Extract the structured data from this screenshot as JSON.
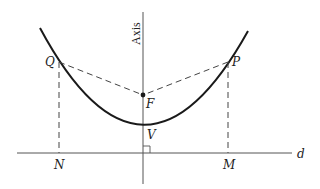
{
  "diagram": {
    "colors": {
      "stroke": "#1a1a1a",
      "dashed": "#444444",
      "text": "#222222",
      "background": "#ffffff"
    },
    "labels": {
      "axis": "Axis",
      "Q": "Q",
      "P": "P",
      "F": "F",
      "V": "V",
      "N": "N",
      "M": "M",
      "d": "d"
    },
    "points": {
      "Q": {
        "x": 59,
        "y": 62
      },
      "P": {
        "x": 228,
        "y": 62
      },
      "F": {
        "x": 143,
        "y": 95
      },
      "V": {
        "x": 143,
        "y": 124
      },
      "N": {
        "x": 59,
        "y": 153
      },
      "M": {
        "x": 228,
        "y": 153
      }
    },
    "elements": [
      "parabola curve",
      "axis of symmetry (vertical)",
      "directrix line d (horizontal)",
      "dashed segment QF",
      "dashed segment PF",
      "dashed segment QN",
      "dashed segment PM",
      "right-angle marker at axis/directrix intersection"
    ]
  }
}
